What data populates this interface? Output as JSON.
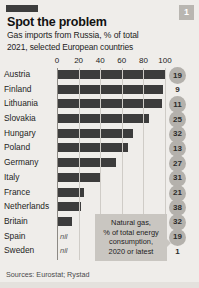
{
  "header": {
    "badge": "1",
    "title": "Spot the problem",
    "subtitle": "Gas imports from Russia, % of total",
    "subtitle2": "2021, selected European countries"
  },
  "callout": {
    "line1": "Natural gas,",
    "line2": "% of total energy",
    "line3": "consumption,",
    "line4": "2020 or latest"
  },
  "source": "Sources: Eurostat; Rystad",
  "colors": {
    "background": "#efedea",
    "bar": "#3c3c3c",
    "circle": "#b4b1ac",
    "callout": "#c9c6c1",
    "grid": "#cfccc7"
  },
  "chart_data": {
    "type": "bar",
    "title": "Spot the problem",
    "subtitle": "Gas imports from Russia, % of total",
    "note": "2021, selected European countries",
    "xlabel": "",
    "ylabel": "",
    "xlim": [
      0,
      100
    ],
    "ticks": [
      0,
      20,
      40,
      60,
      80,
      100
    ],
    "grid": true,
    "orientation": "horizontal",
    "legend": "none",
    "categories": [
      "Austria",
      "Finland",
      "Lithuania",
      "Slovakia",
      "Hungary",
      "Poland",
      "Germany",
      "Italy",
      "France",
      "Netherlands",
      "Britain",
      "Spain",
      "Sweden"
    ],
    "values": [
      100,
      98,
      97,
      85,
      70,
      66,
      55,
      40,
      25,
      22,
      14,
      0,
      0
    ],
    "value_labels": [
      "",
      "",
      "",
      "",
      "",
      "",
      "",
      "",
      "",
      "",
      "",
      "nil",
      "nil"
    ],
    "series": [
      {
        "name": "Gas imports from Russia, % of total",
        "values": [
          100,
          98,
          97,
          85,
          70,
          66,
          55,
          40,
          25,
          22,
          14,
          0,
          0
        ]
      },
      {
        "name": "Natural gas, % of total energy consumption, 2020 or latest",
        "values": [
          19,
          9,
          11,
          25,
          32,
          13,
          27,
          31,
          21,
          38,
          32,
          19,
          1
        ],
        "display": "circle-badges"
      }
    ],
    "rows": [
      {
        "country": "Austria",
        "imports": 100,
        "label": "",
        "consumption": "19",
        "circled": true
      },
      {
        "country": "Finland",
        "imports": 98,
        "label": "",
        "consumption": "9",
        "circled": false
      },
      {
        "country": "Lithuania",
        "imports": 97,
        "label": "",
        "consumption": "11",
        "circled": true
      },
      {
        "country": "Slovakia",
        "imports": 85,
        "label": "",
        "consumption": "25",
        "circled": true
      },
      {
        "country": "Hungary",
        "imports": 70,
        "label": "",
        "consumption": "32",
        "circled": true
      },
      {
        "country": "Poland",
        "imports": 66,
        "label": "",
        "consumption": "13",
        "circled": true
      },
      {
        "country": "Germany",
        "imports": 55,
        "label": "",
        "consumption": "27",
        "circled": true
      },
      {
        "country": "Italy",
        "imports": 40,
        "label": "",
        "consumption": "31",
        "circled": true
      },
      {
        "country": "France",
        "imports": 25,
        "label": "",
        "consumption": "21",
        "circled": true
      },
      {
        "country": "Netherlands",
        "imports": 22,
        "label": "",
        "consumption": "38",
        "circled": true
      },
      {
        "country": "Britain",
        "imports": 14,
        "label": "",
        "consumption": "32",
        "circled": true
      },
      {
        "country": "Spain",
        "imports": 0,
        "label": "nil",
        "consumption": "19",
        "circled": true
      },
      {
        "country": "Sweden",
        "imports": 0,
        "label": "nil",
        "consumption": "1",
        "circled": false
      }
    ]
  }
}
